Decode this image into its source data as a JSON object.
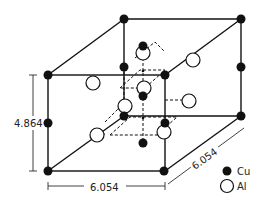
{
  "diagram": {
    "dimensions": {
      "height": "4.864",
      "width": "6.054",
      "depth": "6.054"
    },
    "legend": [
      {
        "symbol": "filled-circle",
        "label": "Cu"
      },
      {
        "symbol": "open-circle",
        "label": "Al"
      }
    ],
    "colors": {
      "line": "#111111",
      "cu_fill": "#111111",
      "al_fill": "#ffffff",
      "background": "#ffffff"
    }
  }
}
